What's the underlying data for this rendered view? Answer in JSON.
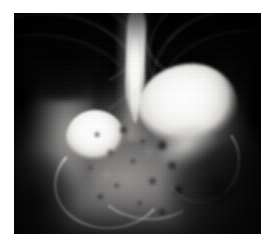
{
  "image": {
    "kind": "radiograph",
    "modality": "X-ray",
    "view": "anteroposterior abdominal / upper gastrointestinal contrast study",
    "title": "",
    "caption": "",
    "frame": {
      "width_px": 276,
      "height_px": 249,
      "border_color": "#ffffff",
      "plate_left_px": 14,
      "plate_top_px": 13,
      "plate_width_px": 247,
      "plate_height_px": 221
    },
    "colors": {
      "background": "#ffffff",
      "film_base": "#000000",
      "contrast_bright": "#ffffff",
      "soft_tissue": "#8e8c8a",
      "bone": "#c4c2be",
      "gas_dark": "#050505"
    },
    "features": [
      {
        "name": "esophagus-contrast-column",
        "description": "vertical bright barium-filled esophagus descending through the mediastinum",
        "position": "upper center",
        "brightness": "very bright"
      },
      {
        "name": "stomach-contrast-pool",
        "description": "large rounded bright contrast collection in the gastric fundus/body",
        "position": "right of midline, upper-middle",
        "brightness": "very bright"
      },
      {
        "name": "bowel-loop-contrast-pool",
        "description": "smaller rounded bright contrast collection in a dependent bowel loop",
        "position": "left of midline, middle",
        "brightness": "very bright"
      },
      {
        "name": "bowel-tube-contrast-streak",
        "description": "thin curved contrast-filled bowel tube sweeping inferiorly and to the left",
        "position": "lower center-left",
        "brightness": "bright thin line"
      },
      {
        "name": "rib-cage-left",
        "description": "posterior rib arcs over the dark left lung field",
        "position": "upper left",
        "brightness": "light grey arcs"
      },
      {
        "name": "rib-cage-right",
        "description": "posterior rib arcs over the dark right lung field",
        "position": "upper right",
        "brightness": "light grey arcs"
      },
      {
        "name": "lung-field-dark-zones",
        "description": "air-filled lung bases appearing black at the top of the film",
        "position": "upper left and upper right corners",
        "brightness": "black"
      },
      {
        "name": "bowel-gas-mottling",
        "description": "mottled mixed gas and stool pattern filling the lower abdomen",
        "position": "lower center",
        "brightness": "mixed grey with dark speckles"
      },
      {
        "name": "vertebral-column",
        "description": "faint midline spine shadow",
        "position": "center, running vertically",
        "brightness": "medium grey"
      },
      {
        "name": "soft-tissue-flank",
        "description": "abdominal wall and flank soft tissue band",
        "position": "left and right margins",
        "brightness": "medium grey"
      }
    ],
    "ribs_left": [
      {
        "left_pct": -12,
        "top_pct": -20,
        "w_pct": 62,
        "h_pct": 52,
        "border_px": 2.4,
        "rot_deg": 14,
        "opacity": 0.72
      },
      {
        "left_pct": -16,
        "top_pct": -10,
        "w_pct": 66,
        "h_pct": 56,
        "border_px": 2.2,
        "rot_deg": 12,
        "opacity": 0.62
      },
      {
        "left_pct": -20,
        "top_pct": 0,
        "w_pct": 70,
        "h_pct": 58,
        "border_px": 2.0,
        "rot_deg": 10,
        "opacity": 0.52
      },
      {
        "left_pct": -24,
        "top_pct": 10,
        "w_pct": 74,
        "h_pct": 58,
        "border_px": 1.8,
        "rot_deg": 8,
        "opacity": 0.42
      }
    ],
    "ribs_right": [
      {
        "left_pct": 52,
        "top_pct": -22,
        "w_pct": 60,
        "h_pct": 52,
        "border_px": 2.4,
        "rot_deg": -14,
        "opacity": 0.7
      },
      {
        "left_pct": 54,
        "top_pct": -12,
        "w_pct": 62,
        "h_pct": 56,
        "border_px": 2.2,
        "rot_deg": -12,
        "opacity": 0.6
      },
      {
        "left_pct": 56,
        "top_pct": -2,
        "w_pct": 64,
        "h_pct": 58,
        "border_px": 2.0,
        "rot_deg": -10,
        "opacity": 0.5
      },
      {
        "left_pct": 58,
        "top_pct": 8,
        "w_pct": 66,
        "h_pct": 58,
        "border_px": 1.8,
        "rot_deg": -8,
        "opacity": 0.4
      }
    ]
  }
}
